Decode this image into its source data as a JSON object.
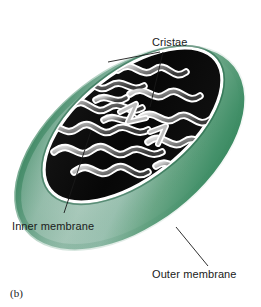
{
  "figure": {
    "caption": "(b)",
    "background_color": "#ffffff"
  },
  "labels": {
    "cristae": "Cristae",
    "inner_membrane": "Inner membrane",
    "outer_membrane": "Outer membrane"
  },
  "colors": {
    "outer_membrane_light": "#a9c9bb",
    "outer_membrane_mid": "#7fb09c",
    "outer_membrane_dark": "#2f8055",
    "outer_membrane_deep": "#3d8a63",
    "matrix_black": "#0a0a0a",
    "cristae_white": "#ffffff",
    "cristae_gray": "#9a9a9a",
    "leader_line": "#1a1a1a",
    "text": "#1a1a1a"
  },
  "structures": {
    "outer_membrane": "smooth green ellipse tilted about -38 degrees",
    "inner_membrane": "dark elongated compartment inset within the outer body",
    "cristae": "white-outlined folded ridges with gray gradient fill on black matrix"
  },
  "leader_lines": {
    "cristae_upper": "from Cristae text down-left to upper crista fold",
    "cristae_lower": "from Cristae text down-left to central crista fold",
    "inner_membrane": "from Inner membrane text up-right to inner membrane boundary",
    "outer_membrane": "from Outer membrane text up-left to outer membrane surface"
  }
}
